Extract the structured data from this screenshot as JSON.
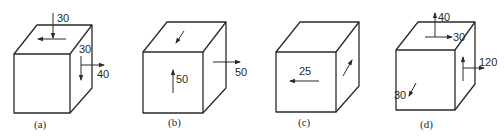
{
  "figure": {
    "colors": {
      "line": "#2a2a2a",
      "background": "#ffffff"
    },
    "panels": [
      {
        "caption": "(a)",
        "labels": {
          "top_normal": "30",
          "right_shear": "30",
          "right_normal": "40"
        }
      },
      {
        "caption": "(b)",
        "labels": {
          "front_shear": "50",
          "right_normal": "50"
        }
      },
      {
        "caption": "(c)",
        "labels": {
          "front_shear": "25"
        }
      },
      {
        "caption": "(d)",
        "labels": {
          "top_normal": "40",
          "top_shear": "30",
          "right_normal": "120",
          "front_shear": "30"
        }
      }
    ]
  }
}
